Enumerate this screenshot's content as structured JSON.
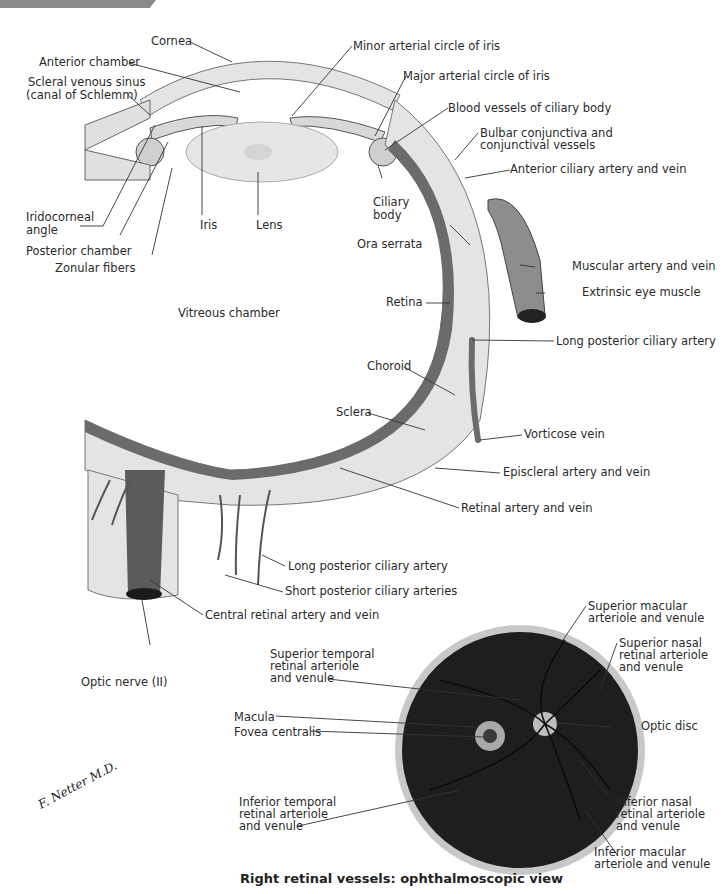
{
  "header": {
    "bar_color": "#8a8a8a"
  },
  "diagram": {
    "cross_section_labels": {
      "cornea": "Cornea",
      "anterior_chamber": "Anterior chamber",
      "scleral_venous_sinus": "Scleral venous sinus\n(canal of Schlemm)",
      "scleral_venous_sinus_l1": "Scleral venous sinus",
      "scleral_venous_sinus_l2": "(canal of Schlemm)",
      "iridocorneal_angle_l1": "Iridocorneal",
      "iridocorneal_angle_l2": "angle",
      "posterior_chamber": "Posterior chamber",
      "zonular_fibers": "Zonular fibers",
      "iris": "Iris",
      "lens": "Lens",
      "ciliary_body_l1": "Ciliary",
      "ciliary_body_l2": "body",
      "minor_arterial_circle": "Minor arterial circle of iris",
      "major_arterial_circle": "Major arterial circle of iris",
      "blood_vessels_ciliary": "Blood vessels of ciliary body",
      "bulbar_conjunctiva_l1": "Bulbar conjunctiva and",
      "bulbar_conjunctiva_l2": "conjunctival vessels",
      "anterior_ciliary": "Anterior ciliary artery and vein",
      "ora_serrata": "Ora serrata",
      "muscular_artery": "Muscular artery and vein",
      "extrinsic_muscle": "Extrinsic eye muscle",
      "vitreous_chamber": "Vitreous chamber",
      "retina": "Retina",
      "long_posterior_ciliary_1": "Long posterior ciliary artery",
      "choroid": "Choroid",
      "sclera": "Sclera",
      "vorticose_vein": "Vorticose vein",
      "episcleral": "Episcleral artery and vein",
      "retinal_artery": "Retinal artery and vein",
      "long_posterior_ciliary_2": "Long posterior ciliary artery",
      "short_posterior_ciliary": "Short posterior ciliary arteries",
      "central_retinal": "Central retinal artery and vein",
      "optic_nerve": "Optic nerve (II)"
    },
    "fundus_labels": {
      "superior_macular_l1": "Superior macular",
      "superior_macular_l2": "arteriole and venule",
      "superior_nasal_l1": "Superior nasal",
      "superior_nasal_l2": "retinal arteriole",
      "superior_nasal_l3": "and venule",
      "superior_temporal_l1": "Superior temporal",
      "superior_temporal_l2": "retinal arteriole",
      "superior_temporal_l3": "and venule",
      "macula": "Macula",
      "fovea": "Fovea centralis",
      "optic_disc": "Optic disc",
      "inferior_temporal_l1": "Inferior temporal",
      "inferior_temporal_l2": "retinal arteriole",
      "inferior_temporal_l3": "and venule",
      "inferior_nasal_l1": "Inferior nasal",
      "inferior_nasal_l2": "retinal arteriole",
      "inferior_nasal_l3": "and venule",
      "inferior_macular_l1": "Inferior macular",
      "inferior_macular_l2": "arteriole and venule"
    },
    "caption": "Right retinal vessels: ophthalmoscopic view",
    "signature": "F. Netter M.D."
  },
  "colors": {
    "sclera_fill": "#e4e4e4",
    "vessel_dark": "#555555",
    "retina_dark": "#6b6b6b",
    "fundus_dark": "#1e1e1e",
    "fundus_rim": "#c8c8c8"
  }
}
